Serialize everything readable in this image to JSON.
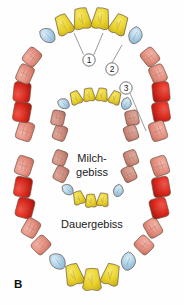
{
  "figure": {
    "panel_label": "B",
    "background_color": "#fefefe",
    "width": 184,
    "height": 305
  },
  "labels": {
    "inner_arch": "Milch-\ngebiss",
    "inner_arch_line1": "Milch-",
    "inner_arch_line2": "gebiss",
    "outer_arch": "Dauergebiss"
  },
  "callouts": [
    {
      "id": "1",
      "number": "1",
      "cx": 89,
      "cy": 60,
      "r": 6.2,
      "leaders": [
        [
          83.5,
          54.5,
          74,
          33
        ],
        [
          93.5,
          55.5,
          103,
          33
        ]
      ]
    },
    {
      "id": "2",
      "number": "2",
      "cx": 112,
      "cy": 69,
      "r": 6.2,
      "leaders": [
        [
          112,
          62.8,
          122,
          45
        ]
      ]
    },
    {
      "id": "3",
      "number": "3",
      "cx": 126,
      "cy": 88,
      "r": 6.2,
      "leaders": [
        [
          130,
          93,
          146,
          131
        ]
      ]
    }
  ],
  "palette": {
    "incisor_yellow": "#E8D22A",
    "incisor_yellow_dark": "#C9B117",
    "canine_blue": "#A9CFE7",
    "canine_blue_dark": "#8FB8D4",
    "premolar_salmon": "#E79183",
    "premolar_salmon_dark": "#CE7668",
    "molar_red": "#E02B20",
    "molar_red_dark": "#B41C14",
    "deciduous_rose": "#D08C7E",
    "outline_brown": "#6D5647",
    "text_dark": "#1B1B1B",
    "leader_grey": "#4A4A4A"
  },
  "legend_semantics": {
    "yellow": "incisors",
    "blue": "canines",
    "salmon": "premolars / anterior molars",
    "red": "molars"
  },
  "permanent_arch": {
    "name": "Dauergebiss",
    "upper_right_to_left": [
      {
        "type": "molar",
        "color": "#E79183",
        "cx": 25,
        "cy": 131,
        "rot": -72,
        "w": 19,
        "h": 16
      },
      {
        "type": "molar",
        "color": "#E02B20",
        "cx": 22,
        "cy": 112,
        "rot": -80,
        "w": 20,
        "h": 17
      },
      {
        "type": "molar",
        "color": "#E02B20",
        "cx": 22,
        "cy": 92,
        "rot": -84,
        "w": 20,
        "h": 17
      },
      {
        "type": "premolar",
        "color": "#E79183",
        "cx": 25,
        "cy": 74,
        "rot": -66,
        "w": 18,
        "h": 15
      },
      {
        "type": "premolar",
        "color": "#E79183",
        "cx": 32,
        "cy": 57,
        "rot": -52,
        "w": 17,
        "h": 15
      },
      {
        "type": "canine",
        "color": "#A9CFE7",
        "cx": 48,
        "cy": 36,
        "rot": -34,
        "w": 16,
        "h": 18
      },
      {
        "type": "incisor",
        "color": "#E8D22A",
        "cx": 64,
        "cy": 25,
        "rot": -24,
        "w": 17,
        "h": 20
      },
      {
        "type": "incisor",
        "color": "#E8D22A",
        "cx": 82,
        "cy": 19,
        "rot": -9,
        "w": 18,
        "h": 21
      },
      {
        "type": "incisor",
        "color": "#E8D22A",
        "cx": 101,
        "cy": 19,
        "rot": 9,
        "w": 18,
        "h": 21
      },
      {
        "type": "incisor",
        "color": "#E8D22A",
        "cx": 119,
        "cy": 25,
        "rot": 24,
        "w": 17,
        "h": 20
      },
      {
        "type": "canine",
        "color": "#A9CFE7",
        "cx": 135,
        "cy": 36,
        "rot": 34,
        "w": 16,
        "h": 18
      },
      {
        "type": "premolar",
        "color": "#E79183",
        "cx": 150,
        "cy": 57,
        "rot": 52,
        "w": 17,
        "h": 15
      },
      {
        "type": "premolar",
        "color": "#E79183",
        "cx": 158,
        "cy": 74,
        "rot": 66,
        "w": 18,
        "h": 15
      },
      {
        "type": "molar",
        "color": "#E02B20",
        "cx": 161,
        "cy": 92,
        "rot": 84,
        "w": 20,
        "h": 17
      },
      {
        "type": "molar",
        "color": "#E02B20",
        "cx": 161,
        "cy": 112,
        "rot": 80,
        "w": 20,
        "h": 17
      },
      {
        "type": "molar",
        "color": "#E79183",
        "cx": 158,
        "cy": 131,
        "rot": 72,
        "w": 19,
        "h": 16
      }
    ],
    "lower_right_to_left": [
      {
        "type": "molar",
        "color": "#E79183",
        "cx": 24,
        "cy": 166,
        "rot": -72,
        "w": 19,
        "h": 16
      },
      {
        "type": "molar",
        "color": "#E02B20",
        "cx": 23,
        "cy": 187,
        "rot": -80,
        "w": 20,
        "h": 17
      },
      {
        "type": "molar",
        "color": "#E02B20",
        "cx": 25,
        "cy": 208,
        "rot": -75,
        "w": 20,
        "h": 17
      },
      {
        "type": "premolar",
        "color": "#E79183",
        "cx": 31,
        "cy": 228,
        "rot": -60,
        "w": 18,
        "h": 15
      },
      {
        "type": "premolar",
        "color": "#E79183",
        "cx": 41,
        "cy": 245,
        "rot": -45,
        "w": 17,
        "h": 15
      },
      {
        "type": "canine",
        "color": "#A9CFE7",
        "cx": 58,
        "cy": 262,
        "rot": -28,
        "w": 17,
        "h": 19
      },
      {
        "type": "incisor",
        "color": "#E8D22A",
        "cx": 74,
        "cy": 275,
        "rot": -16,
        "w": 18,
        "h": 21
      },
      {
        "type": "incisor",
        "color": "#E8D22A",
        "cx": 92,
        "cy": 280,
        "rot": 0,
        "w": 19,
        "h": 22
      },
      {
        "type": "incisor",
        "color": "#E8D22A",
        "cx": 111,
        "cy": 275,
        "rot": 16,
        "w": 18,
        "h": 21
      },
      {
        "type": "canine",
        "color": "#A9CFE7",
        "cx": 128,
        "cy": 262,
        "rot": 28,
        "w": 17,
        "h": 19
      },
      {
        "type": "premolar",
        "color": "#E79183",
        "cx": 144,
        "cy": 245,
        "rot": 45,
        "w": 17,
        "h": 15
      },
      {
        "type": "premolar",
        "color": "#E79183",
        "cx": 153,
        "cy": 228,
        "rot": 60,
        "w": 18,
        "h": 15
      },
      {
        "type": "molar",
        "color": "#E02B20",
        "cx": 159,
        "cy": 208,
        "rot": 75,
        "w": 20,
        "h": 17
      },
      {
        "type": "molar",
        "color": "#E02B20",
        "cx": 161,
        "cy": 187,
        "rot": 80,
        "w": 20,
        "h": 17
      },
      {
        "type": "molar",
        "color": "#E79183",
        "cx": 160,
        "cy": 166,
        "rot": 72,
        "w": 19,
        "h": 16
      }
    ]
  },
  "deciduous_arch": {
    "name": "Milchgebiss",
    "upper_right_to_left": [
      {
        "type": "molar",
        "color": "#D08C7E",
        "cx": 60,
        "cy": 133,
        "rot": -70,
        "w": 15,
        "h": 13
      },
      {
        "type": "molar",
        "color": "#D08C7E",
        "cx": 58,
        "cy": 118,
        "rot": -78,
        "w": 15,
        "h": 13
      },
      {
        "type": "canine",
        "color": "#A9CFE7",
        "cx": 64,
        "cy": 104,
        "rot": -40,
        "w": 12,
        "h": 13
      },
      {
        "type": "incisor",
        "color": "#E8D22A",
        "cx": 76,
        "cy": 98,
        "rot": -22,
        "w": 12,
        "h": 13
      },
      {
        "type": "incisor",
        "color": "#E8D22A",
        "cx": 89,
        "cy": 95,
        "rot": -8,
        "w": 12,
        "h": 13
      },
      {
        "type": "incisor",
        "color": "#E8D22A",
        "cx": 102,
        "cy": 95,
        "rot": 8,
        "w": 12,
        "h": 13
      },
      {
        "type": "incisor",
        "color": "#E8D22A",
        "cx": 115,
        "cy": 98,
        "rot": 22,
        "w": 12,
        "h": 13
      },
      {
        "type": "canine",
        "color": "#A9CFE7",
        "cx": 126,
        "cy": 104,
        "rot": 40,
        "w": 12,
        "h": 13
      },
      {
        "type": "molar",
        "color": "#D08C7E",
        "cx": 132,
        "cy": 118,
        "rot": 78,
        "w": 15,
        "h": 13
      },
      {
        "type": "molar",
        "color": "#D08C7E",
        "cx": 131,
        "cy": 133,
        "rot": 70,
        "w": 15,
        "h": 13
      }
    ],
    "lower_right_to_left": [
      {
        "type": "molar",
        "color": "#D08C7E",
        "cx": 60,
        "cy": 158,
        "rot": -70,
        "w": 15,
        "h": 13
      },
      {
        "type": "molar",
        "color": "#D08C7E",
        "cx": 61,
        "cy": 174,
        "rot": -64,
        "w": 15,
        "h": 13
      },
      {
        "type": "canine",
        "color": "#A9CFE7",
        "cx": 68,
        "cy": 190,
        "rot": -34,
        "w": 12,
        "h": 13
      },
      {
        "type": "incisor",
        "color": "#E8D22A",
        "cx": 79,
        "cy": 198,
        "rot": -18,
        "w": 12,
        "h": 13
      },
      {
        "type": "incisor",
        "color": "#E8D22A",
        "cx": 91,
        "cy": 201,
        "rot": -4,
        "w": 12,
        "h": 13
      },
      {
        "type": "incisor",
        "color": "#E8D22A",
        "cx": 103,
        "cy": 200,
        "rot": 10,
        "w": 12,
        "h": 13
      },
      {
        "type": "canine",
        "color": "#A9CFE7",
        "cx": 118,
        "cy": 191,
        "rot": 36,
        "w": 12,
        "h": 13
      },
      {
        "type": "molar",
        "color": "#D08C7E",
        "cx": 129,
        "cy": 174,
        "rot": 64,
        "w": 15,
        "h": 13
      },
      {
        "type": "molar",
        "color": "#D08C7E",
        "cx": 131,
        "cy": 158,
        "rot": 70,
        "w": 15,
        "h": 13
      }
    ]
  },
  "text_positions": {
    "milch_x": 92,
    "milch_y1": 162,
    "milch_y2": 176,
    "dauer_x": 92,
    "dauer_y": 228,
    "panel_x": 14,
    "panel_y": 288
  }
}
